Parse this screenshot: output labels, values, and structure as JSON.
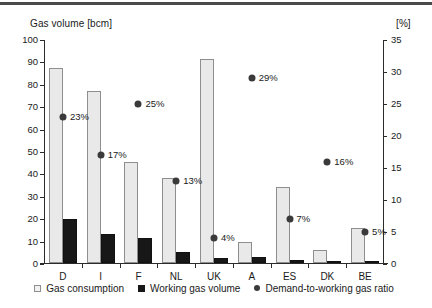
{
  "top_rule_color": "#4a4a4a",
  "axes": {
    "left_title": "Gas volume [bcm]",
    "right_title": "[%]"
  },
  "legend": {
    "items": [
      {
        "label": "Gas consumption",
        "marker": "light-square-icon",
        "color": "#f2f2f2"
      },
      {
        "label": "Working gas volume",
        "marker": "dark-square-icon",
        "color": "#171717"
      },
      {
        "label": "Demand-to-working gas ratio",
        "marker": "dot-icon",
        "color": "#3a3a3a"
      }
    ]
  },
  "chart_data": {
    "type": "bar",
    "title": "",
    "subtitle": "",
    "xlabel": "",
    "ylabel": "Gas volume [bcm]",
    "y2label": "[%]",
    "ylim": [
      0,
      100
    ],
    "y2lim": [
      0,
      35
    ],
    "yticks": [
      0,
      10,
      20,
      30,
      40,
      50,
      60,
      70,
      80,
      90,
      100
    ],
    "y2ticks": [
      0,
      5,
      10,
      15,
      20,
      25,
      30,
      35
    ],
    "grid": false,
    "legend_position": "bottom-center",
    "categories": [
      "D",
      "I",
      "F",
      "NL",
      "UK",
      "A",
      "ES",
      "DK",
      "BE"
    ],
    "series": [
      {
        "name": "Gas consumption",
        "type": "bar",
        "axis": "left",
        "unit": "bcm",
        "color": "#e9e9e9",
        "values": [
          87,
          77,
          45,
          38,
          91,
          9.5,
          34,
          6,
          15.5
        ]
      },
      {
        "name": "Working gas volume",
        "type": "bar",
        "axis": "left",
        "unit": "bcm",
        "color": "#171717",
        "values": [
          19.5,
          13,
          11,
          5,
          2.3,
          2.5,
          1.5,
          0.3,
          0.3
        ]
      },
      {
        "name": "Demand-to-working gas ratio",
        "type": "scatter",
        "axis": "right",
        "unit": "%",
        "color": "#3a3a3a",
        "values": [
          23,
          17,
          25,
          13,
          4,
          29,
          7,
          16,
          5
        ],
        "labels": [
          "23%",
          "17%",
          "25%",
          "13%",
          "4%",
          "29%",
          "7%",
          "16%",
          "5%"
        ]
      }
    ]
  }
}
